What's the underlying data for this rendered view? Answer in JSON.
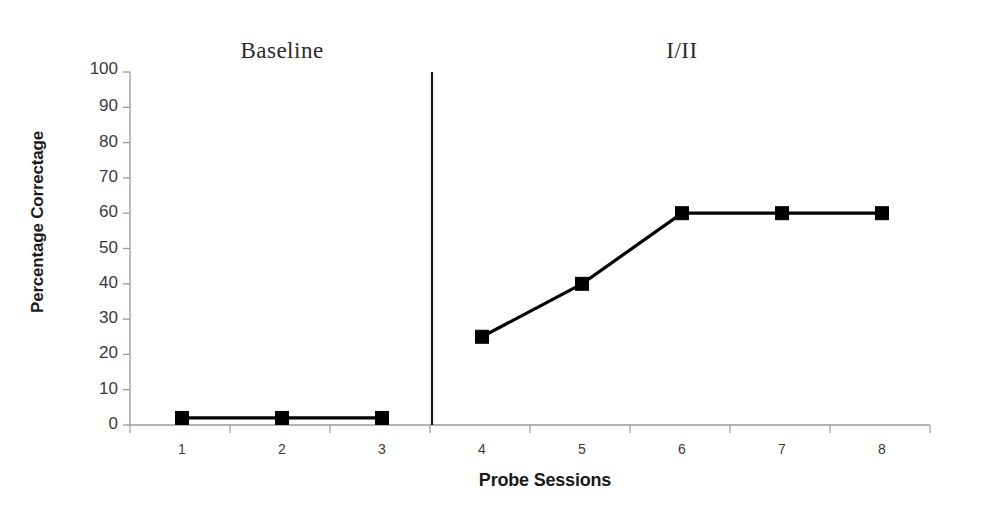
{
  "chart_data": {
    "type": "line",
    "title": "",
    "subtitle": "",
    "xlabel": "Probe Sessions",
    "ylabel": "Percentage Correctage",
    "categories": [
      "1",
      "2",
      "3",
      "4",
      "5",
      "6",
      "7",
      "8"
    ],
    "x": [
      1,
      2,
      3,
      4,
      5,
      6,
      7,
      8
    ],
    "ylim": [
      0,
      100
    ],
    "xlim": [
      0.5,
      8.5
    ],
    "yticks": [
      0,
      10,
      20,
      30,
      40,
      50,
      60,
      70,
      80,
      90,
      100
    ],
    "ytick_labels": [
      "0",
      "10",
      "20",
      "30",
      "40",
      "50",
      "60",
      "70",
      "80",
      "90",
      "100"
    ],
    "xticks": [
      1,
      2,
      3,
      4,
      5,
      6,
      7,
      8
    ],
    "xtick_labels": [
      "1",
      "2",
      "3",
      "4",
      "5",
      "6",
      "7",
      "8"
    ],
    "grid": false,
    "legend": false,
    "legend_position": "none",
    "marker": "square",
    "marker_color": "#000000",
    "line_color": "#000000",
    "series": [
      {
        "name": "Baseline",
        "x": [
          1,
          2,
          3
        ],
        "values": [
          2,
          2,
          2
        ]
      },
      {
        "name": "I/II",
        "x": [
          4,
          5,
          6,
          7,
          8
        ],
        "values": [
          25,
          40,
          60,
          60,
          60
        ]
      }
    ],
    "annotations": [
      {
        "text": "Baseline",
        "kind": "phase-label",
        "x_center": 2
      },
      {
        "text": "I/II",
        "kind": "phase-label",
        "x_center": 6
      }
    ],
    "phase_change_lines": [
      {
        "after_x": 3.5,
        "style": "solid",
        "color": "#1a1a1a"
      }
    ]
  },
  "axes": {
    "y_title": "Percentage Correctage",
    "x_title": "Probe Sessions",
    "y_tick_labels": [
      "100",
      "90",
      "80",
      "70",
      "60",
      "50",
      "40",
      "30",
      "20",
      "10",
      "0"
    ],
    "x_tick_labels": [
      "1",
      "2",
      "3",
      "4",
      "5",
      "6",
      "7",
      "8"
    ]
  },
  "phases": {
    "baseline_label": "Baseline",
    "treatment_label": "I/II"
  },
  "colors": {
    "line": "#000000",
    "marker": "#000000",
    "axis": "#9a9a9a",
    "phase_divider": "#1a1a1a",
    "text": "#2b2b2b",
    "background": "#ffffff"
  }
}
